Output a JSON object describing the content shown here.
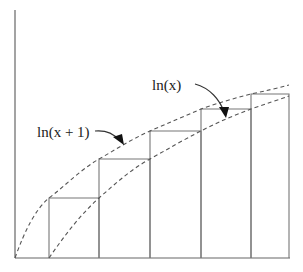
{
  "diagram": {
    "labels": {
      "ln_x": "ln(x)",
      "ln_x_plus_1": "ln(x + 1)"
    },
    "axes": {
      "origin": [
        15,
        258
      ],
      "y_top": 10,
      "x_right": 290
    },
    "bars": [
      {
        "x0": 49,
        "x1": 99,
        "top": 198
      },
      {
        "x0": 99,
        "x1": 150,
        "top": 159
      },
      {
        "x0": 150,
        "x1": 201,
        "top": 131
      },
      {
        "x0": 201,
        "x1": 251,
        "top": 109
      },
      {
        "x0": 251,
        "x1": 289,
        "top": 94
      }
    ],
    "curves": {
      "ln_x_plus_1": "M15,258 C25,230 35,210 49,198 C65,186 80,170 99,159 C115,150 130,140 150,131 C168,123 185,116 201,109 C218,103 235,98 251,94 C265,91 278,88 289,85",
      "ln_x": "M49,258 C65,235 80,215 99,198 C115,184 130,170 150,159 C168,149 185,139 201,131 C218,122 235,115 251,109 C265,104 278,100 289,96"
    },
    "arrows": {
      "ln_x": "M195,84 C210,88 220,100 224,112",
      "ln_x_plus_1": "M95,131 C106,130 114,134 119,140"
    },
    "arrowheads": {
      "ln_x": "219,107 229,107 226,118",
      "ln_x_plus_1": "113,137 122,134 124,145"
    }
  }
}
